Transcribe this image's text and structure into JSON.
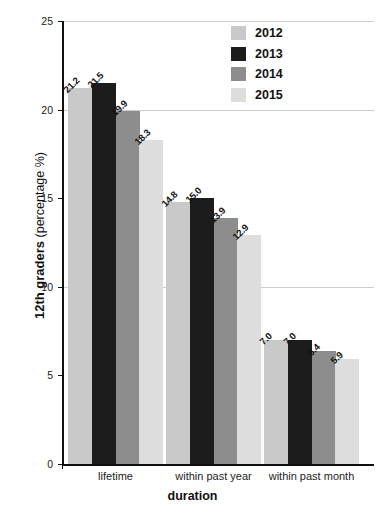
{
  "chart_data": {
    "type": "bar",
    "title": "",
    "xlabel": "duration",
    "ylabel": "12th graders (percentage %)",
    "ylabel_bold_part": "12th graders",
    "ylabel_rest": " (percentage %)",
    "ylim": [
      0,
      25
    ],
    "yticks": [
      0,
      5,
      10,
      15,
      20,
      25
    ],
    "ytick_labels": [
      "0",
      "5",
      "10",
      "15",
      "20",
      "25"
    ],
    "grid": true,
    "gridlines_at": [
      10,
      20,
      25
    ],
    "legend_position": "top-right",
    "categories": [
      "lifetime",
      "within past year",
      "within past month"
    ],
    "series": [
      {
        "name": "2012",
        "color": "#c9c9c9",
        "values": [
          21.2,
          14.8,
          7.0
        ],
        "labels": [
          "21.2",
          "14.8",
          "7.0"
        ]
      },
      {
        "name": "2013",
        "color": "#1c1c1c",
        "values": [
          21.5,
          15.0,
          7.0
        ],
        "labels": [
          "21.5",
          "15.0",
          "7.0"
        ]
      },
      {
        "name": "2014",
        "color": "#8d8d8d",
        "values": [
          19.9,
          13.9,
          6.4
        ],
        "labels": [
          "19.9",
          "13.9",
          "6.4"
        ]
      },
      {
        "name": "2015",
        "color": "#dddddd",
        "values": [
          18.3,
          12.9,
          5.9
        ],
        "labels": [
          "18.3",
          "12.9",
          "5.9"
        ]
      }
    ]
  },
  "legend": {
    "items": [
      {
        "label": "2012",
        "color": "#c9c9c9"
      },
      {
        "label": "2013",
        "color": "#1c1c1c"
      },
      {
        "label": "2014",
        "color": "#8d8d8d"
      },
      {
        "label": "2015",
        "color": "#dddddd"
      }
    ]
  },
  "axes": {
    "y_title_bold": "12th graders",
    "y_title_rest": " (percentage %)",
    "x_title": "duration",
    "y_tick_labels": [
      "25",
      "20",
      "15",
      "10",
      "5",
      "0"
    ],
    "x_tick_labels": [
      "lifetime",
      "within past year",
      "within past month"
    ]
  },
  "caption_fragment": ""
}
